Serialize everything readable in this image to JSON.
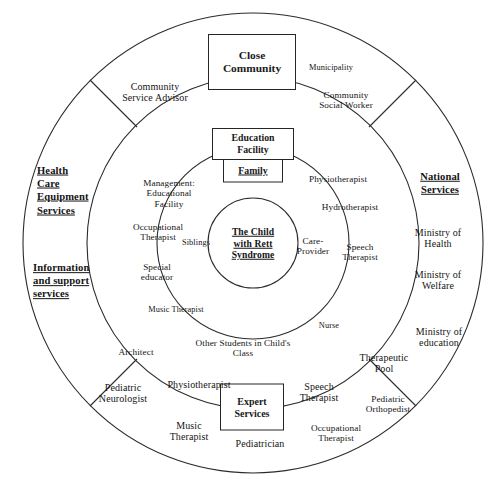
{
  "diagram": {
    "core": {
      "label": "The Child\nwith Rett\nSyndrome"
    },
    "boxes": {
      "close_community": "Close\nCommunity",
      "education_facility": "Education\nFacility",
      "family": "Family",
      "expert_services": "Expert\nServices"
    },
    "sector_headers": {
      "health_care_equipment": "Health\nCare\nEquipment\nServices",
      "information_support": "Information\nand support\nservices",
      "national_services": "National\nServices"
    },
    "family_ring": {
      "siblings": "Siblings",
      "care_provider": "Care-\nProvider"
    },
    "education_ring": {
      "management_educational_facility": "Management:\nEducational\nFacility",
      "occupational_therapist": "Occupational\nTherapist",
      "special_educator": "Special\neducator",
      "music_therapist": "Music Therapist",
      "other_students": "Other Students in Child's\nClass",
      "physiotherapist": "Physiotherapist",
      "hydrotherapist": "Hydrotherapist",
      "speech_therapist": "Speech\nTherapist",
      "nurse": "Nurse"
    },
    "close_community_ring": {
      "community_service_advisor": "Community\nService Advisor",
      "municipality": "Municipality",
      "community_social_worker": "Community\nSocial Worker"
    },
    "national_services_ring": {
      "ministry_of_health": "Ministry of\nHealth",
      "ministry_of_welfare": "Ministry of\nWelfare",
      "ministry_of_education": "Ministry of\neducation"
    },
    "expert_services_ring": {
      "architect": "Architect",
      "pediatric_neurologist": "Pediatric\nNeurologist",
      "physiotherapist": "Physiotherapist",
      "music_therapist": "Music\nTherapist",
      "pediatrician": "Pediatrician",
      "speech_therapist": "Speech\nTherapist",
      "occupational_therapist": "Occupational\nTherapist",
      "therapeutic_pool": "Therapeutic\nPool",
      "pediatric_orthopedist": "Pediatric\nOrthopedist"
    },
    "style": {
      "stroke_color": "#2b2b2b",
      "text_color": "#141414",
      "background": "#ffffff"
    }
  }
}
